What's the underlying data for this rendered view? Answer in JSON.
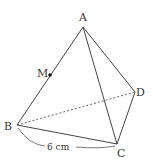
{
  "figure": {
    "type": "tetrahedron",
    "vertices": {
      "A": {
        "label": "A",
        "x": 83,
        "y": 27
      },
      "B": {
        "label": "B",
        "x": 17,
        "y": 125
      },
      "C": {
        "label": "C",
        "x": 117,
        "y": 144
      },
      "D": {
        "label": "D",
        "x": 135,
        "y": 92
      }
    },
    "point_M": {
      "label": "M",
      "x": 50,
      "y": 75
    },
    "dimension": {
      "label": "6 cm",
      "edge": "BC"
    },
    "colors": {
      "line": "#444444",
      "hidden": "#666666",
      "text": "#333333"
    }
  }
}
